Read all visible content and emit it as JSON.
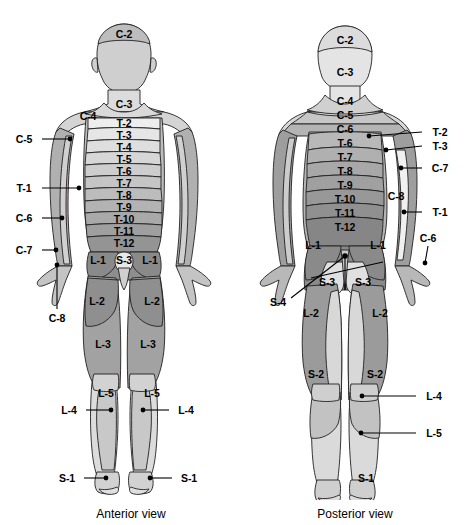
{
  "figure": {
    "captions": [
      {
        "id": "anterior",
        "text": "Anterior view",
        "x": 131,
        "y": 514
      },
      {
        "id": "posterior",
        "text": "Posterior view",
        "x": 355,
        "y": 514
      }
    ],
    "colors": {
      "outline": "#231f20",
      "background": "#ffffff",
      "text": "#000000",
      "leader": "#000000",
      "shade_lightest": "#ededed",
      "shade_light": "#dcdcdc",
      "shade_mid_light": "#cfcfcf",
      "shade_mid": "#bdbdbd",
      "shade_mid_dark": "#ababab",
      "shade_dark": "#9a9a9a",
      "shade_darkest": "#8a8a8a"
    }
  },
  "anterior": {
    "name": "Anterior view",
    "inner_labels": [
      {
        "text": "C-2",
        "x": 124,
        "y": 34
      },
      {
        "text": "C-3",
        "x": 124,
        "y": 104
      },
      {
        "text": "C-4",
        "x": 88,
        "y": 116
      },
      {
        "text": "T-2",
        "x": 124,
        "y": 123
      },
      {
        "text": "T-3",
        "x": 124,
        "y": 135
      },
      {
        "text": "T-4",
        "x": 124,
        "y": 147
      },
      {
        "text": "T-5",
        "x": 124,
        "y": 159
      },
      {
        "text": "T-6",
        "x": 124,
        "y": 171
      },
      {
        "text": "T-7",
        "x": 124,
        "y": 183
      },
      {
        "text": "T-8",
        "x": 124,
        "y": 195
      },
      {
        "text": "T-9",
        "x": 124,
        "y": 207
      },
      {
        "text": "T-10",
        "x": 124,
        "y": 219
      },
      {
        "text": "T-11",
        "x": 124,
        "y": 231
      },
      {
        "text": "T-12",
        "x": 124,
        "y": 243
      },
      {
        "text": "L-1",
        "x": 98,
        "y": 260
      },
      {
        "text": "S-3",
        "x": 124,
        "y": 260
      },
      {
        "text": "L-1",
        "x": 150,
        "y": 260
      },
      {
        "text": "L-2",
        "x": 97,
        "y": 301
      },
      {
        "text": "L-2",
        "x": 152,
        "y": 301
      },
      {
        "text": "L-3",
        "x": 103,
        "y": 344
      },
      {
        "text": "L-3",
        "x": 148,
        "y": 344
      },
      {
        "text": "L-5",
        "x": 106,
        "y": 393
      },
      {
        "text": "L-5",
        "x": 152,
        "y": 393
      }
    ],
    "leader_labels": [
      {
        "text": "C-5",
        "label_x": 24,
        "label_y": 139,
        "line_x1": 42,
        "line_y1": 139,
        "dot_x": 70,
        "dot_y": 139
      },
      {
        "text": "T-1",
        "label_x": 24,
        "label_y": 188,
        "line_x1": 42,
        "line_y1": 188,
        "dot_x": 79,
        "dot_y": 188
      },
      {
        "text": "C-6",
        "label_x": 24,
        "label_y": 218,
        "line_x1": 42,
        "line_y1": 218,
        "dot_x": 62,
        "dot_y": 218
      },
      {
        "text": "C-7",
        "label_x": 24,
        "label_y": 250,
        "line_x1": 42,
        "line_y1": 250,
        "dot_x": 56,
        "dot_y": 250
      },
      {
        "text": "C-8",
        "label_x": 57,
        "label_y": 318,
        "line_x1": 57,
        "line_y1": 309,
        "dot_x": 57,
        "dot_y": 265
      },
      {
        "text": "L-4",
        "label_x": 69,
        "label_y": 410,
        "line_x1": 86,
        "line_y1": 410,
        "dot_x": 111,
        "dot_y": 410
      },
      {
        "text": "L-4",
        "label_x": 186,
        "label_y": 410,
        "line_x1": 169,
        "line_y1": 410,
        "dot_x": 143,
        "dot_y": 410
      },
      {
        "text": "S-1",
        "label_x": 67,
        "label_y": 478,
        "line_x1": 84,
        "line_y1": 478,
        "dot_x": 106,
        "dot_y": 478
      },
      {
        "text": "S-1",
        "label_x": 189,
        "label_y": 478,
        "line_x1": 172,
        "line_y1": 478,
        "dot_x": 150,
        "dot_y": 478
      }
    ]
  },
  "posterior": {
    "name": "Posterior view",
    "inner_labels": [
      {
        "text": "C-2",
        "x": 345,
        "y": 40
      },
      {
        "text": "C-3",
        "x": 345,
        "y": 72
      },
      {
        "text": "C-4",
        "x": 345,
        "y": 101
      },
      {
        "text": "C-5",
        "x": 345,
        "y": 115
      },
      {
        "text": "C-6",
        "x": 345,
        "y": 129
      },
      {
        "text": "T-6",
        "x": 345,
        "y": 143
      },
      {
        "text": "T-7",
        "x": 345,
        "y": 157
      },
      {
        "text": "T-8",
        "x": 345,
        "y": 171
      },
      {
        "text": "T-9",
        "x": 345,
        "y": 185
      },
      {
        "text": "T-10",
        "x": 345,
        "y": 199
      },
      {
        "text": "T-11",
        "x": 345,
        "y": 213
      },
      {
        "text": "T-12",
        "x": 345,
        "y": 227
      },
      {
        "text": "C-8",
        "x": 396,
        "y": 196
      },
      {
        "text": "L-1",
        "x": 313,
        "y": 245
      },
      {
        "text": "L-1",
        "x": 378,
        "y": 245
      },
      {
        "text": "S-3",
        "x": 327,
        "y": 282
      },
      {
        "text": "S-3",
        "x": 363,
        "y": 282
      },
      {
        "text": "L-2",
        "x": 311,
        "y": 313
      },
      {
        "text": "L-2",
        "x": 380,
        "y": 313
      },
      {
        "text": "S-2",
        "x": 316,
        "y": 374
      },
      {
        "text": "S-2",
        "x": 375,
        "y": 374
      },
      {
        "text": "S-1",
        "x": 366,
        "y": 478
      }
    ],
    "leader_labels": [
      {
        "text": "T-2",
        "label_x": 440,
        "label_y": 132,
        "line_x1": 422,
        "line_y1": 132,
        "dot_x": 369,
        "dot_y": 136
      },
      {
        "text": "T-3",
        "label_x": 440,
        "label_y": 146,
        "line_x1": 422,
        "line_y1": 146,
        "dot_x": 386,
        "dot_y": 150
      },
      {
        "text": "C-7",
        "label_x": 440,
        "label_y": 168,
        "line_x1": 422,
        "line_y1": 168,
        "dot_x": 401,
        "dot_y": 168
      },
      {
        "text": "T-1",
        "label_x": 440,
        "label_y": 212,
        "line_x1": 422,
        "line_y1": 212,
        "dot_x": 404,
        "dot_y": 212
      },
      {
        "text": "C-6",
        "label_x": 428,
        "label_y": 238,
        "line_x1": 428,
        "line_y1": 246,
        "dot_x": 425,
        "dot_y": 263
      },
      {
        "text": "L-4",
        "label_x": 434,
        "label_y": 396,
        "line_x1": 416,
        "line_y1": 396,
        "dot_x": 362,
        "dot_y": 396
      },
      {
        "text": "L-5",
        "label_x": 434,
        "label_y": 433,
        "line_x1": 416,
        "line_y1": 433,
        "dot_x": 361,
        "dot_y": 433
      },
      {
        "text": "S-4",
        "label_x": 278,
        "label_y": 302,
        "line_x1": 291,
        "line_y1": 298,
        "dot_x": 345,
        "dot_y": 256
      }
    ]
  }
}
